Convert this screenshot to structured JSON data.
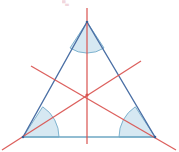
{
  "figure": {
    "background_color": "#ffffff",
    "width": 179,
    "height": 152,
    "partial_top_label": "▀▄",
    "partial_top_label_color": "#e7b7c2"
  },
  "colors": {
    "triangle_side_stroke": "#4a6fa5",
    "triangle_base_stroke": "#6fa8c4",
    "triangle_fill": "#ffffff",
    "bisector_stroke": "#d9534f",
    "angle_arc_fill": "#cfe4f0",
    "angle_arc_stroke": "#7fb3cf",
    "incenter_marker": "#d9534f"
  },
  "triangle": {
    "name": "isosceles-triangle",
    "vertices": [
      {
        "id": "apex",
        "label": "A",
        "x": 87,
        "y": 22
      },
      {
        "id": "bottom-left",
        "label": "B",
        "x": 23,
        "y": 137
      },
      {
        "id": "bottom-right",
        "label": "C",
        "x": 155,
        "y": 137
      }
    ],
    "sides": [
      {
        "id": "left-side",
        "from": "apex",
        "to": "bottom-left",
        "stroke": "#4a6fa5",
        "width": 1.4
      },
      {
        "id": "right-side",
        "from": "apex",
        "to": "bottom-right",
        "stroke": "#4a6fa5",
        "width": 1.4
      },
      {
        "id": "base",
        "from": "bottom-left",
        "to": "bottom-right",
        "stroke": "#6fa8c4",
        "width": 1.6
      }
    ]
  },
  "angle_arcs": [
    {
      "id": "apex-angle-arc",
      "vertex": "apex",
      "radius": 31,
      "fill": "#cfe4f0",
      "stroke": "#7fb3cf",
      "path": "M 87 22 L 70.0 48.0 A 31 31 0 0 0 104.0 48.0 Z"
    },
    {
      "id": "bottom-left-angle-arc",
      "vertex": "bottom-left",
      "radius": 36,
      "fill": "#cfe4f0",
      "stroke": "#7fb3cf",
      "path": "M 23 137 L 59 137 A 36 36 0 0 0 42.7 106.8 Z"
    },
    {
      "id": "bottom-right-angle-arc",
      "vertex": "bottom-right",
      "radius": 36,
      "fill": "#cfe4f0",
      "stroke": "#7fb3cf",
      "path": "M 155 137 L 135.3 106.8 A 36 36 0 0 0 119 137 Z"
    }
  ],
  "bisectors": [
    {
      "id": "bisector-from-apex",
      "name": "vertical-bisector",
      "from_vertex": "apex",
      "x1": 87,
      "y1": 8,
      "x2": 87,
      "y2": 144,
      "stroke": "#d9534f",
      "width": 1.3
    },
    {
      "id": "bisector-from-bottom-left",
      "name": "left-bisector",
      "from_vertex": "bottom-left",
      "x1": 2,
      "y1": 150,
      "x2": 141,
      "y2": 61,
      "stroke": "#d9534f",
      "width": 1.3
    },
    {
      "id": "bisector-from-bottom-right",
      "name": "right-bisector",
      "from_vertex": "bottom-right",
      "x1": 176,
      "y1": 150,
      "x2": 31,
      "y2": 66,
      "stroke": "#d9534f",
      "width": 1.3
    }
  ],
  "incenter": {
    "id": "incenter-point",
    "label": "I",
    "x": 87,
    "y": 95,
    "color": "#d9534f",
    "radius": 1.6
  }
}
